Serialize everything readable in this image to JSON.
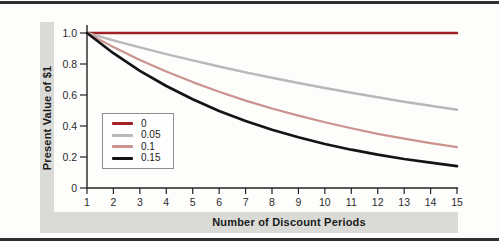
{
  "figure": {
    "background": "#fdfdfc",
    "band_color": "#dadad7",
    "rule_color": "#2f2f2f",
    "axis_color": "#222222",
    "tick_label_color": "#2b2b2b"
  },
  "chart_data": {
    "type": "line",
    "title": "",
    "xlabel": "Number of Discount Periods",
    "ylabel": "Present Value of $1",
    "x": [
      1,
      2,
      3,
      4,
      5,
      6,
      7,
      8,
      9,
      10,
      11,
      12,
      13,
      14,
      15
    ],
    "xtick_labels": [
      "1",
      "2",
      "3",
      "4",
      "5",
      "6",
      "7",
      "8",
      "9",
      "10",
      "11",
      "12",
      "13",
      "14",
      "15"
    ],
    "xlim": [
      1,
      15
    ],
    "ylim": [
      0,
      1.0
    ],
    "yticks": [
      0,
      0.2,
      0.4,
      0.6,
      0.8,
      1.0
    ],
    "ytick_labels": [
      "0",
      "0.2",
      "0.4",
      "0.6",
      "0.8",
      "1.0"
    ],
    "grid": false,
    "legend_position": "lower-left-inside",
    "series": [
      {
        "name": "0",
        "rate": 0,
        "color": "#a12127",
        "width": 2.5,
        "values": [
          1,
          1,
          1,
          1,
          1,
          1,
          1,
          1,
          1,
          1,
          1,
          1,
          1,
          1,
          1
        ]
      },
      {
        "name": "0.05",
        "rate": 0.05,
        "color": "#b8b8b8",
        "width": 2.5,
        "values": [
          1,
          0.952,
          0.907,
          0.864,
          0.823,
          0.784,
          0.746,
          0.711,
          0.677,
          0.645,
          0.614,
          0.585,
          0.557,
          0.53,
          0.505
        ]
      },
      {
        "name": "0.1",
        "rate": 0.1,
        "color": "#ca938f",
        "width": 2.2,
        "values": [
          1,
          0.909,
          0.826,
          0.751,
          0.683,
          0.621,
          0.564,
          0.513,
          0.467,
          0.424,
          0.386,
          0.35,
          0.319,
          0.29,
          0.263
        ]
      },
      {
        "name": "0.15",
        "rate": 0.15,
        "color": "#141414",
        "width": 2.7,
        "values": [
          1,
          0.87,
          0.756,
          0.658,
          0.572,
          0.497,
          0.432,
          0.376,
          0.327,
          0.284,
          0.247,
          0.215,
          0.187,
          0.163,
          0.141
        ]
      }
    ]
  }
}
